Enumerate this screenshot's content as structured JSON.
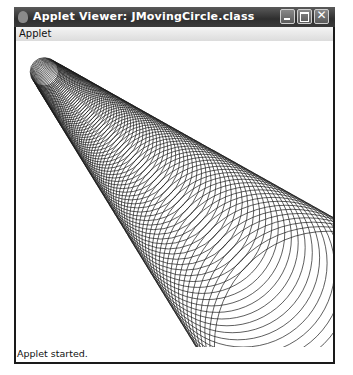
{
  "window": {
    "title": "Applet Viewer: JMovingCircle.class",
    "title_icon": "java-cup-icon",
    "buttons": [
      {
        "name": "minimize",
        "icon": "minimize-icon"
      },
      {
        "name": "maximize",
        "icon": "maximize-icon"
      },
      {
        "name": "close",
        "icon": "close-icon",
        "glyph": "✕"
      }
    ]
  },
  "menubar": {
    "items": [
      {
        "label": "Applet"
      }
    ]
  },
  "canvas": {
    "drawing": "moving-circles",
    "stroke_color": "#1a1a1a",
    "apex": [
      -12,
      -9
    ],
    "direction_deg": 43.9,
    "half_angle_deg": 14.65,
    "start_distance": 56,
    "end_distance": 450,
    "circle_count": 90
  },
  "statusbar": {
    "text": "Applet started."
  }
}
